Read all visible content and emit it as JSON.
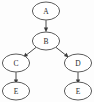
{
  "diagram": {
    "type": "directed-tree",
    "background_color": "#fdfdfd",
    "node_fill": "#ffffff",
    "node_stroke": "#4a4a4a",
    "edge_color": "#4a4a4a",
    "label_color": "#2b2b2b",
    "nodes": [
      {
        "id": "a",
        "label": "A",
        "cx": 46,
        "cy": 11,
        "rx": 14,
        "ry": 9
      },
      {
        "id": "b",
        "label": "B",
        "cx": 46,
        "cy": 41,
        "rx": 14,
        "ry": 9
      },
      {
        "id": "c",
        "label": "C",
        "cx": 16,
        "cy": 63,
        "rx": 14,
        "ry": 9
      },
      {
        "id": "d",
        "label": "D",
        "cx": 78,
        "cy": 63,
        "rx": 14,
        "ry": 9
      },
      {
        "id": "e1",
        "label": "E",
        "cx": 16,
        "cy": 91,
        "rx": 14,
        "ry": 9
      },
      {
        "id": "e2",
        "label": "E",
        "cx": 78,
        "cy": 91,
        "rx": 14,
        "ry": 9
      }
    ],
    "edges": [
      {
        "id": "a-b",
        "from": "A",
        "to": "B",
        "directed": true
      },
      {
        "id": "b-c",
        "from": "B",
        "to": "C",
        "directed": true
      },
      {
        "id": "b-d",
        "from": "B",
        "to": "D",
        "directed": true
      },
      {
        "id": "c-e1",
        "from": "C",
        "to": "E",
        "directed": true
      },
      {
        "id": "d-e2",
        "from": "D",
        "to": "E",
        "directed": true
      }
    ]
  }
}
